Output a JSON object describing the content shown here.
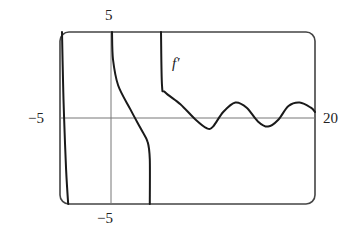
{
  "chart_data": {
    "type": "line",
    "title": "",
    "xlabel": "",
    "ylabel": "",
    "xlim": [
      -5,
      20
    ],
    "ylim": [
      -5,
      5
    ],
    "grid": false,
    "legend": null,
    "tick_labels": {
      "x_min": "−5",
      "x_max": "20",
      "y_max": "5",
      "y_min": "−5"
    },
    "annotations": [
      {
        "text": "f′",
        "x": 5.5,
        "y": 3.2
      }
    ],
    "series": [
      {
        "name": "f′ branch 1 (near vertical asymptote, left)",
        "points": [
          [
            -4.8,
            5
          ],
          [
            -4.7,
            2
          ],
          [
            -4.6,
            0
          ],
          [
            -4.4,
            -3
          ],
          [
            -4.2,
            -5
          ]
        ]
      },
      {
        "name": "f′ branch 2",
        "points": [
          [
            0.1,
            5
          ],
          [
            0.2,
            3.4
          ],
          [
            0.7,
            1.9
          ],
          [
            1.9,
            0.5
          ],
          [
            2.9,
            -0.6
          ],
          [
            3.6,
            -1.4
          ],
          [
            3.8,
            -2.4
          ],
          [
            3.8,
            -5
          ]
        ]
      },
      {
        "name": "f′ branch 3",
        "points": [
          [
            4.9,
            5
          ],
          [
            5.0,
            1.9
          ],
          [
            5.3,
            1.5
          ],
          [
            6.8,
            0.8
          ],
          [
            8.3,
            -0.1
          ],
          [
            9.4,
            -0.6
          ],
          [
            10.0,
            -0.5
          ],
          [
            11.0,
            0.35
          ],
          [
            12.2,
            0.9
          ],
          [
            13.3,
            0.6
          ],
          [
            14.4,
            -0.2
          ],
          [
            15.4,
            -0.5
          ],
          [
            16.4,
            -0.1
          ],
          [
            17.4,
            0.7
          ],
          [
            18.5,
            0.9
          ],
          [
            19.6,
            0.6
          ],
          [
            20.0,
            0.35
          ]
        ]
      }
    ]
  }
}
